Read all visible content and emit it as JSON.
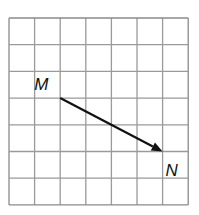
{
  "diagram": {
    "type": "vector-on-grid",
    "grid": {
      "columns": 7,
      "rows": 7,
      "origin_px": [
        9,
        18
      ],
      "cell_width_px": 25.6,
      "cell_height_px": 26.7,
      "line_color": "#9a9a9a",
      "border_color": "#8a8a8a"
    },
    "points": [
      {
        "name": "M",
        "grid": [
          2,
          3
        ],
        "label_offset": [
          -26,
          -8
        ]
      },
      {
        "name": "N",
        "grid": [
          6,
          5
        ],
        "label_offset": [
          3,
          24
        ]
      }
    ],
    "vector": {
      "from": "M",
      "to": "N",
      "color": "#111111",
      "arrowhead": "at N"
    }
  }
}
